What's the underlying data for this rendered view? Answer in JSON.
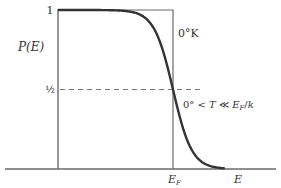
{
  "chart_data": {
    "type": "line",
    "title": "",
    "xlabel": "E",
    "ylabel": "P(E)",
    "ylim": [
      0,
      1
    ],
    "y_ticks": [
      {
        "value": 1,
        "label": "1"
      },
      {
        "value": 0.5,
        "label": "½"
      }
    ],
    "x_ticks": [
      {
        "value": 1,
        "label": "E",
        "sub": "F"
      }
    ],
    "x_axis_label": "E",
    "x_range_in_EF_units": [
      -0.99,
      1.7
    ],
    "reference_line": {
      "y": 0.5,
      "style": "dashed",
      "x_end_in_EF_units": 0.26
    },
    "series": [
      {
        "name": "0°K",
        "label": "0°K",
        "kind": "step",
        "description": "P = 1 for E < E_F, 0 for E > E_F",
        "step_at": 1
      },
      {
        "name": "0° < T ≪ E_F/k",
        "label_parts": [
          "0° < ",
          "T",
          " ≪ ",
          "E",
          "F",
          "/",
          "k"
        ],
        "kind": "fermi-dirac",
        "kT_in_EF_units": 0.082
      }
    ],
    "colors": {
      "axis": "#6a6a6a",
      "curve": "#333333",
      "dash": "#777777"
    }
  }
}
